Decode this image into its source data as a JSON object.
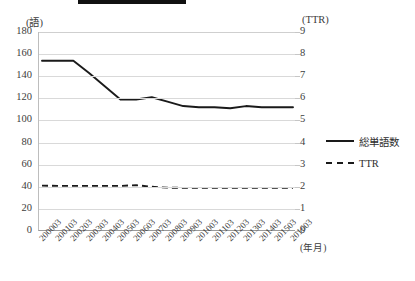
{
  "title_bar": {
    "redacted": true,
    "label": ""
  },
  "axes": {
    "left_unit": "(語)",
    "right_unit": "(TTR)",
    "x_axis_title": "(年月)",
    "left_ticks": [
      "180",
      "160",
      "140",
      "120",
      "100",
      "80",
      "60",
      "40",
      "20",
      "0"
    ],
    "right_ticks": [
      "9",
      "8",
      "7",
      "6",
      "5",
      "4",
      "3",
      "2",
      "1",
      "0"
    ]
  },
  "legend": {
    "items": [
      {
        "label": "総単語数",
        "style": "solid"
      },
      {
        "label": "TTR",
        "style": "dashed"
      }
    ]
  },
  "chart_data": {
    "type": "line",
    "title": "",
    "xlabel": "(年月)",
    "ylabel": "(語)",
    "y2label": "(TTR)",
    "ylim": [
      0,
      180
    ],
    "y2lim": [
      0,
      9
    ],
    "ytick_step": 20,
    "y2tick_step": 1,
    "grid": true,
    "legend_position": "right",
    "categories": [
      "200003",
      "200103",
      "200203",
      "200303",
      "200403",
      "200503",
      "200603",
      "200703",
      "200803",
      "200903",
      "201003",
      "201103",
      "201203",
      "201303",
      "201403",
      "201503",
      "201603"
    ],
    "series": [
      {
        "name": "総単語数",
        "axis": "left",
        "style": "solid",
        "color": "#1a1a1a",
        "values": [
          154,
          154,
          154,
          143,
          131,
          119,
          119,
          121,
          117,
          113,
          112,
          112,
          111,
          113,
          112,
          112,
          112
        ]
      },
      {
        "name": "TTR",
        "axis": "right",
        "style": "dashed",
        "color": "#1a1a1a",
        "values": [
          2.05,
          2.04,
          2.04,
          2.04,
          2.04,
          2.04,
          2.07,
          2.0,
          1.96,
          1.95,
          1.95,
          1.95,
          1.95,
          1.95,
          1.95,
          1.95,
          1.95
        ]
      }
    ]
  }
}
